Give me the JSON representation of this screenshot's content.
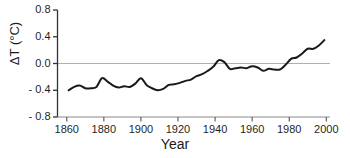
{
  "chart_data": {
    "type": "line",
    "title": "",
    "xlabel": "Year",
    "ylabel": "ΔT (°C)",
    "xlim": [
      1855,
      2002
    ],
    "ylim": [
      -0.8,
      0.8
    ],
    "xticks": [
      1860,
      1880,
      1900,
      1920,
      1940,
      1960,
      1980,
      2000
    ],
    "xtick_labels": [
      "1860",
      "1880",
      "1900",
      "1920",
      "1940",
      "1960",
      "1980",
      "2000"
    ],
    "yticks": [
      -0.8,
      -0.4,
      0.0,
      0.4,
      0.8
    ],
    "ytick_labels": [
      "- 0.8",
      "- 0.4",
      "0.0",
      "0.4",
      "0.8"
    ],
    "grid": false,
    "legend": "none",
    "zero_reference_line": {
      "y": 0.0,
      "color": "#b0b0b0",
      "visible": true
    },
    "line_color": "#1a1a1a",
    "line_width": 2.0,
    "series": [
      {
        "name": "Global temperature anomaly",
        "x": [
          1861,
          1864,
          1867,
          1870,
          1873,
          1876,
          1879,
          1882,
          1885,
          1888,
          1891,
          1894,
          1897,
          1900,
          1903,
          1906,
          1909,
          1912,
          1915,
          1918,
          1921,
          1924,
          1927,
          1930,
          1933,
          1936,
          1939,
          1942,
          1945,
          1948,
          1951,
          1954,
          1957,
          1960,
          1963,
          1966,
          1969,
          1972,
          1975,
          1978,
          1981,
          1984,
          1987,
          1990,
          1993,
          1996,
          1999
        ],
        "y": [
          -0.4,
          -0.35,
          -0.33,
          -0.37,
          -0.37,
          -0.35,
          -0.22,
          -0.27,
          -0.33,
          -0.36,
          -0.34,
          -0.35,
          -0.3,
          -0.22,
          -0.32,
          -0.37,
          -0.4,
          -0.38,
          -0.32,
          -0.31,
          -0.29,
          -0.26,
          -0.24,
          -0.19,
          -0.16,
          -0.11,
          -0.05,
          0.05,
          0.02,
          -0.08,
          -0.07,
          -0.06,
          -0.07,
          -0.04,
          -0.06,
          -0.11,
          -0.08,
          -0.09,
          -0.09,
          -0.02,
          0.07,
          0.09,
          0.15,
          0.22,
          0.22,
          0.27,
          0.35
        ]
      }
    ]
  },
  "axes": {
    "x_axis_label": "Year",
    "y_axis_label": "ΔT (°C)"
  }
}
